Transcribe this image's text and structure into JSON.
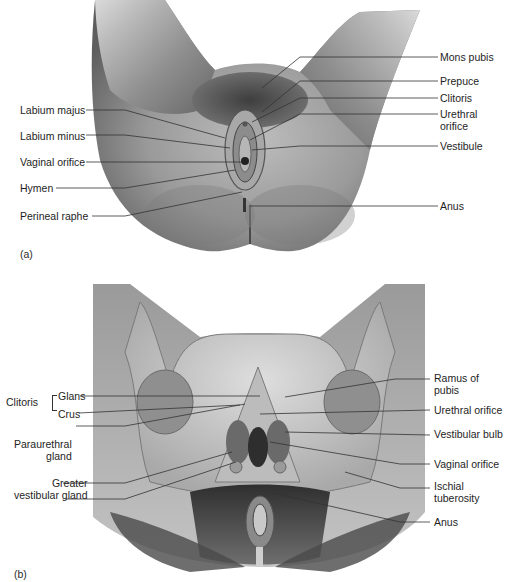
{
  "figure": {
    "panels": [
      {
        "id": "a",
        "tag": "(a)",
        "view": "external genitalia, inferior view",
        "labels_left": [
          "Labium majus",
          "Labium minus",
          "Vaginal orifice",
          "Hymen",
          "Perineal raphe"
        ],
        "labels_right": [
          "Mons pubis",
          "Prepuce",
          "Clitoris",
          "Urethral\norifice",
          "Vestibule",
          "Anus"
        ]
      },
      {
        "id": "b",
        "tag": "(b)",
        "view": "deep structures with pelvic bones",
        "labels_left": {
          "group": "Clitoris",
          "group_items": [
            "Glans",
            "Crus"
          ],
          "items": [
            "Paraurethral\ngland",
            "Greater\nvestibular gland"
          ]
        },
        "labels_right": [
          "Ramus of\npubis",
          "Urethral orifice",
          "Vestibular bulb",
          "Vaginal orifice",
          "Ischial\ntuberosity",
          "Anus"
        ]
      }
    ]
  },
  "text": {
    "a_tag": "(a)",
    "b_tag": "(b)",
    "a_labium_majus": "Labium majus",
    "a_labium_minus": "Labium minus",
    "a_vaginal_orifice": "Vaginal orifice",
    "a_hymen": "Hymen",
    "a_perineal_raphe": "Perineal raphe",
    "a_mons_pubis": "Mons pubis",
    "a_prepuce": "Prepuce",
    "a_clitoris": "Clitoris",
    "a_urethral_1": "Urethral",
    "a_urethral_2": "orifice",
    "a_vestibule": "Vestibule",
    "a_anus": "Anus",
    "b_clitoris": "Clitoris",
    "b_glans": "Glans",
    "b_crus": "Crus",
    "b_paraurethral_1": "Paraurethral",
    "b_paraurethral_2": "gland",
    "b_greater_1": "Greater",
    "b_greater_2": "vestibular gland",
    "b_ramus_1": "Ramus of",
    "b_ramus_2": "pubis",
    "b_urethral": "Urethral orifice",
    "b_vestibular_bulb": "Vestibular bulb",
    "b_vaginal": "Vaginal orifice",
    "b_ischial_1": "Ischial",
    "b_ischial_2": "tuberosity",
    "b_anus": "Anus"
  },
  "colors": {
    "skin_light": "#d9d9d9",
    "skin_dark": "#6a6a6a",
    "line": "#2b2b2b",
    "background": "#ffffff"
  }
}
